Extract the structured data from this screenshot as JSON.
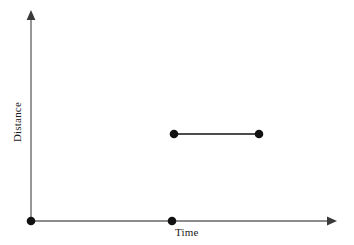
{
  "figure": {
    "background_color": "#ffffff",
    "axis_color": "#8c8c8c",
    "mark_color": "#111111"
  },
  "axes": {
    "x": {
      "label": "Time",
      "origin_px": [
        31,
        221
      ],
      "tip_px": [
        337,
        221
      ],
      "arrowhead": "arrow-right"
    },
    "y": {
      "label": "Distance",
      "origin_px": [
        31,
        221
      ],
      "tip_px": [
        31,
        10
      ],
      "arrowhead": "arrow-up"
    }
  },
  "chart_data": {
    "type": "scatter",
    "title": "",
    "xlabel": "Time",
    "ylabel": "Distance",
    "grid": false,
    "legend": null,
    "xlim": [
      0,
      1
    ],
    "ylim": [
      0,
      1
    ],
    "xticks": [],
    "yticks": [],
    "xticklabels": [],
    "yticklabels": [],
    "series": [
      {
        "name": "origin-point",
        "kind": "point",
        "points": [
          {
            "x": 0.0,
            "y": 0.0
          }
        ],
        "pixels": [
          [
            31,
            221
          ]
        ],
        "marker": "filled-circle",
        "marker_size_px": 8
      },
      {
        "name": "time-axis-point",
        "kind": "point",
        "points": [
          {
            "x": 0.46,
            "y": 0.0
          }
        ],
        "pixels": [
          [
            172,
            221
          ]
        ],
        "marker": "filled-circle",
        "marker_size_px": 8
      },
      {
        "name": "constant-distance-segment",
        "kind": "segment",
        "points": [
          {
            "x": 0.47,
            "y": 0.41
          },
          {
            "x": 0.75,
            "y": 0.41
          }
        ],
        "pixels": [
          [
            174,
            134
          ],
          [
            259,
            134
          ]
        ],
        "marker": "filled-circle",
        "marker_size_px": 8,
        "line_width_px": 1.6
      }
    ]
  }
}
